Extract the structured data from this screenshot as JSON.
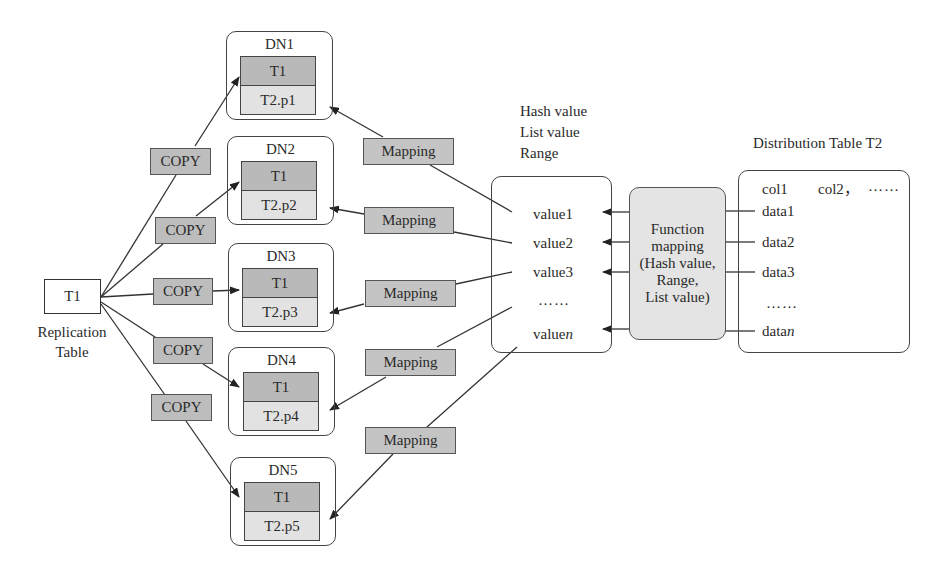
{
  "replication": {
    "table_label": "T1",
    "caption_line1": "Replication",
    "caption_line2": "Table"
  },
  "copy_labels": [
    "COPY",
    "COPY",
    "COPY",
    "COPY",
    "COPY"
  ],
  "data_nodes": [
    {
      "name": "DN1",
      "t1": "T1",
      "t2": "T2.p1"
    },
    {
      "name": "DN2",
      "t1": "T1",
      "t2": "T2.p2"
    },
    {
      "name": "DN3",
      "t1": "T1",
      "t2": "T2.p3"
    },
    {
      "name": "DN4",
      "t1": "T1",
      "t2": "T2.p4"
    },
    {
      "name": "DN5",
      "t1": "T1",
      "t2": "T2.p5"
    }
  ],
  "mapping_labels": [
    "Mapping",
    "Mapping",
    "Mapping",
    "Mapping",
    "Mapping"
  ],
  "value_header": {
    "line1": "Hash value",
    "line2": "List value",
    "line3": "Range"
  },
  "values": {
    "v1": "value1",
    "v2": "value2",
    "v3": "value3",
    "ellipsis": "……",
    "vn_prefix": "value",
    "vn_suffix": "n"
  },
  "function_mapping": {
    "line1": "Function",
    "line2": "mapping",
    "line3": "(Hash value,",
    "line4": "Range,",
    "line5": "List value)"
  },
  "distribution_table": {
    "title": "Distribution Table T2",
    "col1": "col1",
    "col2": "col2，",
    "col_more": "……",
    "d1": "data1",
    "d2": "data2",
    "d3": "data3",
    "ellipsis": "……",
    "dn_prefix": "data",
    "dn_suffix": "n"
  },
  "colors": {
    "copy_fill": "#bdbdbd",
    "mapping_fill": "#c4c4c4",
    "t1_cell_fill": "#b9b9b9",
    "t2_cell_fill": "#e2e2e2",
    "function_fill": "#e4e4e4",
    "stroke": "#444444"
  }
}
